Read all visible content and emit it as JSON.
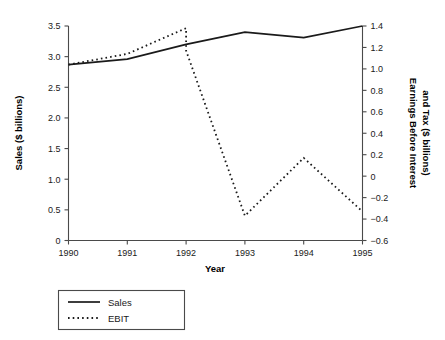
{
  "chart_data": {
    "type": "line",
    "title": "",
    "xlabel": "Year",
    "ylabel": "Sales ($ billions)",
    "y2label": "Earnings Before Interest and Tax ($ billions)",
    "categories": [
      "1990",
      "1991",
      "1992",
      "1993",
      "1994",
      "1995"
    ],
    "x": [
      1990,
      1991,
      1992,
      1993,
      1994,
      1995
    ],
    "xlim": [
      1990,
      1995
    ],
    "ylim": [
      0,
      3.5
    ],
    "y2lim": [
      -0.6,
      1.4
    ],
    "grid": false,
    "legend_position": "below-left",
    "series": [
      {
        "name": "Sales",
        "axis": "left",
        "style": "solid",
        "values": [
          2.87,
          2.96,
          3.2,
          3.4,
          3.31,
          3.5
        ]
      },
      {
        "name": "EBIT",
        "axis": "right",
        "style": "dotted",
        "values": [
          1.04,
          1.14,
          1.38,
          -0.37,
          0.17,
          -0.33
        ],
        "note": "drops vertically at 1992 from 1.38 to 1.17 before descending to 1993"
      }
    ],
    "y_ticks": [
      "0",
      "0.5",
      "1.0",
      "1.5",
      "2.0",
      "2.5",
      "3.0",
      "3.5"
    ],
    "y_tick_values": [
      0,
      0.5,
      1.0,
      1.5,
      2.0,
      2.5,
      3.0,
      3.5
    ],
    "y2_ticks": [
      "−0.6",
      "−0.4",
      "−0.2",
      "0",
      "0.2",
      "0.4",
      "0.6",
      "0.8",
      "1.0",
      "1.2",
      "1.4"
    ],
    "y2_tick_values": [
      -0.6,
      -0.4,
      -0.2,
      0,
      0.2,
      0.4,
      0.6,
      0.8,
      1.0,
      1.2,
      1.4
    ],
    "x_ticks": [
      "1990",
      "1991",
      "1992",
      "1993",
      "1994",
      "1995"
    ]
  },
  "axes": {
    "left_title": "Sales ($ billions)",
    "right_title_line1": "Earnings Before Interest",
    "right_title_line2": "and Tax ($ billions)",
    "bottom_title": "Year"
  },
  "legend": {
    "entries": [
      {
        "label": "Sales",
        "style": "solid"
      },
      {
        "label": "EBIT",
        "style": "dotted"
      }
    ]
  }
}
